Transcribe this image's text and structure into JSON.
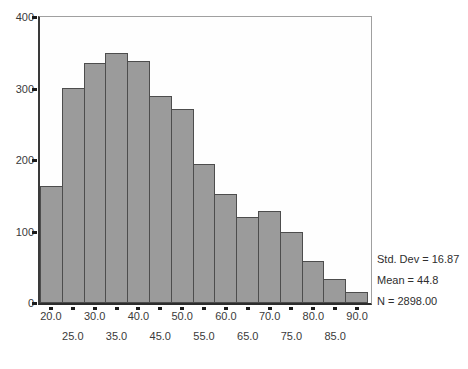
{
  "chart_data": {
    "type": "bar",
    "subtype": "histogram",
    "title": "",
    "xlabel": "",
    "ylabel": "",
    "bin_width": 5,
    "bin_centers": [
      20.0,
      25.0,
      30.0,
      35.0,
      40.0,
      45.0,
      50.0,
      55.0,
      60.0,
      65.0,
      70.0,
      75.0,
      80.0,
      85.0,
      90.0
    ],
    "values": [
      163,
      301,
      336,
      350,
      338,
      289,
      272,
      194,
      152,
      121,
      129,
      99,
      59,
      34,
      15
    ],
    "x_tick_labels": [
      "20.0",
      "25.0",
      "30.0",
      "35.0",
      "40.0",
      "45.0",
      "50.0",
      "55.0",
      "60.0",
      "65.0",
      "70.0",
      "75.0",
      "80.0",
      "85.0",
      "90.0"
    ],
    "x_labels_staggered": true,
    "y_ticks": [
      0,
      100,
      200,
      300,
      400
    ],
    "y_tick_labels": [
      "0",
      "100",
      "200",
      "300",
      "400"
    ],
    "ylim": [
      0,
      400
    ],
    "grid": false,
    "legend": null,
    "annotation_lines": [
      "Std. Dev = 16.87",
      "Mean = 44.8",
      "N = 2898.00"
    ],
    "stats": {
      "std_dev": "16.87",
      "mean": "44.8",
      "n": "2898.00"
    },
    "colors": {
      "bar_fill": "#9b9b9b",
      "bar_border": "#4d4d4d",
      "axis": "#2d2d2d",
      "frame": "#a0a0a0",
      "tick": "#1c1c1c",
      "text": "#3a3a3a",
      "background": "#ffffff"
    }
  }
}
